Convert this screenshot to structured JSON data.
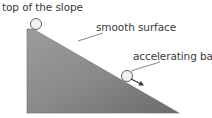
{
  "diagram": {
    "labels": {
      "top": "top of the slope",
      "surface": "smooth surface",
      "ball": "accelerating ball"
    },
    "colors": {
      "slope_light": "#a8a8a8",
      "slope_dark": "#6e6e6e",
      "ball_fill": "#f2f2f2",
      "ball_stroke": "#555555",
      "leader_line": "#555555",
      "text": "#3a3a3a"
    },
    "elements": [
      "slope",
      "ball-at-top",
      "ball-on-incline",
      "direction-arrow"
    ]
  }
}
